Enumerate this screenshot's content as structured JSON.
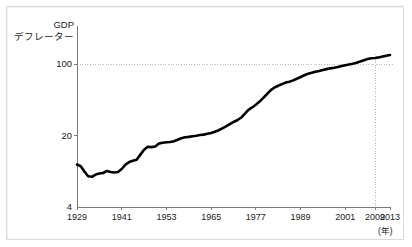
{
  "chart_data": {
    "type": "line",
    "title": "",
    "ylabel_line1": "GDP",
    "ylabel_line2": "デフレーター",
    "xlabel": "",
    "x_unit_label": "(年)",
    "yscale": "log",
    "ylim": [
      4,
      130
    ],
    "xlim": [
      1929,
      2013
    ],
    "ytick_labels": [
      "100",
      "20",
      "4"
    ],
    "ytick_values": [
      100,
      20,
      4
    ],
    "xtick_labels": [
      "1929",
      "1941",
      "1953",
      "1965",
      "1977",
      "1989",
      "2001",
      "2009",
      "2013"
    ],
    "xtick_values": [
      1929,
      1941,
      1953,
      1965,
      1977,
      1989,
      2001,
      2009,
      2013
    ],
    "grid": "horizontal-dotted-at-100-and-vertical-dotted-at-2009",
    "gridlines_h": [
      100
    ],
    "gridlines_v": [
      2009
    ],
    "legend": "none",
    "series": [
      {
        "name": "GDP deflator",
        "color": "#000000",
        "line_width": 2.6,
        "x": [
          1929,
          1930,
          1931,
          1932,
          1933,
          1934,
          1935,
          1936,
          1937,
          1938,
          1939,
          1940,
          1941,
          1942,
          1943,
          1944,
          1945,
          1946,
          1947,
          1948,
          1949,
          1950,
          1951,
          1952,
          1953,
          1954,
          1955,
          1956,
          1957,
          1958,
          1959,
          1960,
          1961,
          1962,
          1963,
          1964,
          1965,
          1966,
          1967,
          1968,
          1969,
          1970,
          1971,
          1972,
          1973,
          1974,
          1975,
          1976,
          1977,
          1978,
          1979,
          1980,
          1981,
          1982,
          1983,
          1984,
          1985,
          1986,
          1987,
          1988,
          1989,
          1990,
          1991,
          1992,
          1993,
          1994,
          1995,
          1996,
          1997,
          1998,
          1999,
          2000,
          2001,
          2002,
          2003,
          2004,
          2005,
          2006,
          2007,
          2008,
          2009,
          2010,
          2011,
          2012,
          2013
        ],
        "y": [
          10.4,
          10.0,
          8.9,
          8.0,
          7.9,
          8.3,
          8.5,
          8.6,
          9.0,
          8.8,
          8.7,
          8.8,
          9.4,
          10.4,
          11.0,
          11.3,
          11.6,
          13.0,
          14.5,
          15.5,
          15.4,
          15.6,
          16.7,
          17.0,
          17.2,
          17.3,
          17.6,
          18.2,
          18.8,
          19.2,
          19.4,
          19.7,
          19.9,
          20.2,
          20.4,
          20.8,
          21.2,
          21.8,
          22.5,
          23.5,
          24.6,
          25.9,
          27.1,
          28.2,
          29.8,
          32.5,
          35.6,
          37.6,
          40.0,
          42.9,
          46.6,
          50.9,
          55.6,
          58.9,
          61.3,
          63.6,
          65.8,
          67.2,
          69.2,
          71.8,
          74.6,
          77.7,
          80.2,
          82.0,
          83.9,
          85.6,
          87.4,
          89.1,
          90.7,
          91.8,
          93.3,
          95.4,
          97.3,
          98.8,
          100.5,
          102.9,
          105.9,
          109.0,
          111.8,
          114.0,
          114.6,
          116.0,
          118.4,
          120.6,
          122.3
        ]
      }
    ],
    "axis_color": "#7a7a7a",
    "grid_color": "#b4b4b4",
    "background": "#ffffff",
    "frame_color": "#d9d9d9"
  },
  "geometry": {
    "plot_left": 77,
    "plot_right": 390,
    "plot_bottom": 207,
    "y_at_100": 64,
    "y_at_20": 140,
    "y_at_4": 207,
    "plot_top": 26
  }
}
